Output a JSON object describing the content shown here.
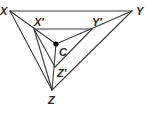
{
  "diagram": {
    "type": "geometry",
    "points": {
      "X": {
        "label": "X",
        "x": 10,
        "y": 11
      },
      "Y": {
        "label": "Y",
        "x": 132,
        "y": 11
      },
      "Z": {
        "label": "Z",
        "x": 52,
        "y": 90
      },
      "Xp": {
        "label": "X′",
        "x": 34,
        "y": 29
      },
      "Yp": {
        "label": "Y′",
        "x": 92,
        "y": 29
      },
      "Zp": {
        "label": "Z′",
        "x": 55,
        "y": 67
      },
      "C": {
        "label": "C",
        "x": 56,
        "y": 44
      }
    },
    "labels": {
      "X": "X",
      "Y": "Y",
      "Z": "Z",
      "Xp": "X′",
      "Yp": "Y′",
      "Zp": "Z′",
      "C": "C"
    },
    "segments": [
      [
        "X",
        "Y"
      ],
      [
        "Y",
        "Z"
      ],
      [
        "Z",
        "X"
      ],
      [
        "Xp",
        "Yp"
      ],
      [
        "Yp",
        "Zp"
      ],
      [
        "Zp",
        "Xp"
      ],
      [
        "X",
        "C"
      ],
      [
        "Y",
        "C"
      ],
      [
        "Z",
        "C"
      ],
      [
        "Xp",
        "Z"
      ]
    ],
    "colors": {
      "line": "#3a3a3a",
      "text": "#2a2a2a",
      "background": "#ffffff"
    }
  }
}
